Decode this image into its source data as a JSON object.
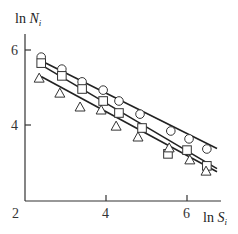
{
  "chart_data": {
    "type": "scatter",
    "title": "",
    "xlabel": "ln S_i",
    "ylabel": "ln N_i",
    "xlim": [
      2,
      6.8
    ],
    "ylim": [
      2,
      6.4
    ],
    "xticks": [
      2,
      4,
      6
    ],
    "yticks": [
      4,
      6
    ],
    "x_origin_label": "2",
    "grid": false,
    "legend": null,
    "series": [
      {
        "name": "circles",
        "marker": "circle",
        "x": [
          2.4,
          2.91,
          3.41,
          3.93,
          4.32,
          4.84,
          5.6,
          6.05,
          6.49
        ],
        "y": [
          5.81,
          5.49,
          5.15,
          4.93,
          4.64,
          4.29,
          3.84,
          3.63,
          3.36
        ],
        "fit_line": {
          "x": [
            2.2,
            6.8
          ],
          "y": [
            5.82,
            3.34
          ]
        }
      },
      {
        "name": "squares",
        "marker": "square",
        "x": [
          2.4,
          2.91,
          3.41,
          3.93,
          4.32,
          4.89,
          5.53,
          6.0,
          6.49
        ],
        "y": [
          5.65,
          5.31,
          4.96,
          4.64,
          4.32,
          3.92,
          3.23,
          3.33,
          2.91
        ],
        "fit_line": {
          "x": [
            2.2,
            6.8
          ],
          "y": [
            5.73,
            2.8
          ]
        }
      },
      {
        "name": "triangles",
        "marker": "triangle",
        "x": [
          2.35,
          2.86,
          3.36,
          3.88,
          4.25,
          4.79,
          5.56,
          6.07,
          6.47
        ],
        "y": [
          5.25,
          4.85,
          4.48,
          4.4,
          3.97,
          3.68,
          3.39,
          3.07,
          2.77
        ],
        "fit_line": {
          "x": [
            2.2,
            6.8
          ],
          "y": [
            5.41,
            2.72
          ]
        }
      }
    ]
  },
  "labels": {
    "ylabel_main": "ln ",
    "ylabel_var": "N",
    "ylabel_sub": "i",
    "xlabel_main": "ln ",
    "xlabel_var": "S",
    "xlabel_sub": "i",
    "xtick_2": "2",
    "xtick_4": "4",
    "xtick_6": "6",
    "ytick_4": "4",
    "ytick_6": "6"
  }
}
